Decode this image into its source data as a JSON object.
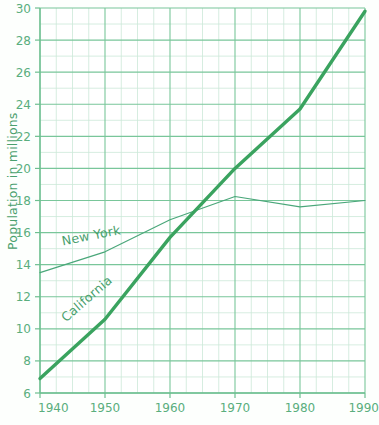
{
  "chart_data": {
    "type": "line",
    "title": "",
    "xlabel": "",
    "ylabel": "Population in millions",
    "xlim": [
      1940,
      1990
    ],
    "ylim": [
      6,
      30
    ],
    "grid": true,
    "legend_position": "inline-labels",
    "x_ticks": [
      1940,
      1950,
      1960,
      1970,
      1980,
      1990
    ],
    "x_tick_labels": [
      "1940",
      "1950",
      "1960",
      "1970",
      "1980",
      "1990"
    ],
    "x_minor_step": 2.5,
    "y_ticks": [
      6,
      8,
      10,
      12,
      14,
      16,
      18,
      20,
      22,
      24,
      26,
      28,
      30
    ],
    "y_tick_labels": [
      "6",
      "8",
      "10",
      "12",
      "14",
      "16",
      "18",
      "20",
      "22",
      "24",
      "26",
      "28",
      "30"
    ],
    "y_minor_step": 1,
    "x": [
      1940,
      1950,
      1960,
      1970,
      1980,
      1990
    ],
    "series": [
      {
        "name": "California",
        "label": "California",
        "color": "#3aa35f",
        "line_width": 3.4,
        "values": [
          6.9,
          10.6,
          15.7,
          20.0,
          23.7,
          29.8
        ]
      },
      {
        "name": "New York",
        "label": "New York",
        "color": "#4aa77a",
        "line_width": 1.2,
        "values": [
          13.5,
          14.8,
          16.8,
          18.25,
          17.6,
          18.0
        ]
      }
    ],
    "annotations": [
      {
        "text": "New York",
        "x": 1943.5,
        "y": 15.2,
        "rotation": -11
      },
      {
        "text": "California",
        "x": 1944.0,
        "y": 10.4,
        "rotation": -41
      }
    ]
  },
  "axis": {
    "y_title": "Population in millions"
  },
  "colors": {
    "line_primary": "#3aa35f",
    "line_secondary": "#4aa77a",
    "grid_major": "#7cc89c",
    "grid_minor": "#c3e4d0",
    "text": "#5aae7e",
    "background": "#fdfffd"
  },
  "footer": {
    "source_fragment": ""
  }
}
